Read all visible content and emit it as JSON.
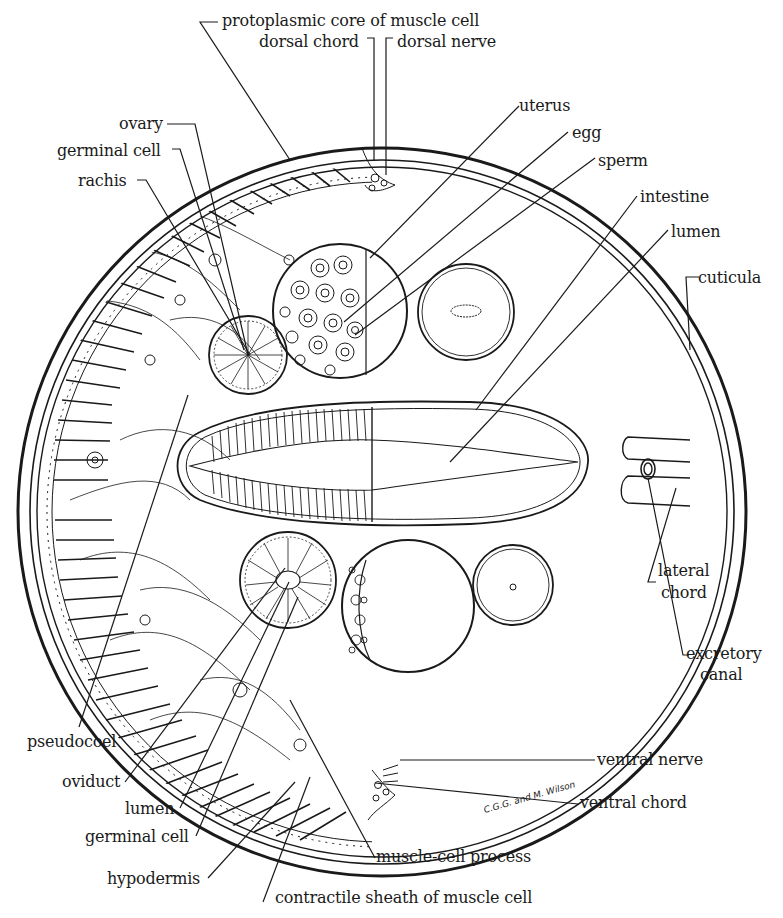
{
  "figure": {
    "signature": "C.G.G. and M. Wilson",
    "colors": {
      "ink": "#1a1a1a",
      "background": "#ffffff"
    }
  },
  "labels": {
    "protoplasmic_core": "protoplasmic core of muscle cell",
    "dorsal_chord": "dorsal chord",
    "dorsal_nerve": "dorsal nerve",
    "uterus": "uterus",
    "egg": "egg",
    "sperm": "sperm",
    "intestine": "intestine",
    "lumen_top": "lumen",
    "cuticula": "cuticula",
    "ovary": "ovary",
    "germinal_cell_top": "germinal cell",
    "rachis": "rachis",
    "lateral_chord_1": "lateral",
    "lateral_chord_2": "chord",
    "excretory_canal_1": "excretory",
    "excretory_canal_2": "canal",
    "pseudocoel": "pseudocoel",
    "oviduct": "oviduct",
    "lumen_bottom": "lumen",
    "germinal_cell_bottom": "germinal cell",
    "hypodermis": "hypodermis",
    "ventral_nerve": "ventral nerve",
    "ventral_chord": "ventral chord",
    "muscle_cell_process": "muscle-cell process",
    "contractile_sheath": "contractile sheath of muscle cell"
  }
}
